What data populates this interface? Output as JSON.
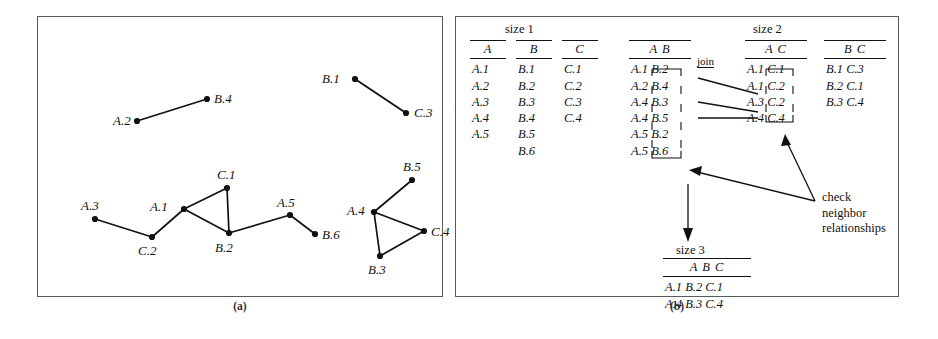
{
  "figure": {
    "caption_a": "(a)",
    "caption_b": "(b)"
  },
  "graph": {
    "nodes": [
      {
        "id": "A.2",
        "label": "A.2",
        "x": 100,
        "y": 105,
        "lx": 76,
        "ly": 98
      },
      {
        "id": "B.4",
        "label": "B.4",
        "x": 170,
        "y": 83,
        "lx": 177,
        "ly": 76
      },
      {
        "id": "B.1",
        "label": "B.1",
        "x": 318,
        "y": 63,
        "lx": 285,
        "ly": 56
      },
      {
        "id": "C.3",
        "label": "C.3",
        "x": 369,
        "y": 97,
        "lx": 377,
        "ly": 90
      },
      {
        "id": "A.3",
        "label": "A.3",
        "x": 58,
        "y": 203,
        "lx": 44,
        "ly": 183
      },
      {
        "id": "C.2",
        "label": "C.2",
        "x": 115,
        "y": 221,
        "lx": 101,
        "ly": 228
      },
      {
        "id": "A.1",
        "label": "A.1",
        "x": 147,
        "y": 193,
        "lx": 113,
        "ly": 184
      },
      {
        "id": "C.1",
        "label": "C.1",
        "x": 190,
        "y": 172,
        "lx": 180,
        "ly": 152
      },
      {
        "id": "B.2",
        "label": "B.2",
        "x": 192,
        "y": 217,
        "lx": 178,
        "ly": 225
      },
      {
        "id": "A.5",
        "label": "A.5",
        "x": 253,
        "y": 199,
        "lx": 240,
        "ly": 180
      },
      {
        "id": "B.6",
        "label": "B.6",
        "x": 278,
        "y": 218,
        "lx": 285,
        "ly": 212
      },
      {
        "id": "A.4",
        "label": "A.4",
        "x": 337,
        "y": 196,
        "lx": 310,
        "ly": 188
      },
      {
        "id": "B.5",
        "label": "B.5",
        "x": 375,
        "y": 164,
        "lx": 366,
        "ly": 144
      },
      {
        "id": "B.3",
        "label": "B.3",
        "x": 343,
        "y": 240,
        "lx": 331,
        "ly": 247
      },
      {
        "id": "C.4",
        "label": "C.4",
        "x": 387,
        "y": 215,
        "lx": 394,
        "ly": 209
      }
    ],
    "edges": [
      [
        "A.2",
        "B.4"
      ],
      [
        "B.1",
        "C.3"
      ],
      [
        "A.3",
        "C.2"
      ],
      [
        "C.2",
        "A.1"
      ],
      [
        "A.1",
        "C.1"
      ],
      [
        "A.1",
        "B.2"
      ],
      [
        "C.1",
        "B.2"
      ],
      [
        "B.2",
        "A.5"
      ],
      [
        "A.5",
        "B.6"
      ],
      [
        "A.4",
        "B.5"
      ],
      [
        "A.4",
        "B.3"
      ],
      [
        "A.4",
        "C.4"
      ],
      [
        "B.3",
        "C.4"
      ]
    ]
  },
  "tables": {
    "size1_heading": "size 1",
    "size2_heading": "size 2",
    "size3_heading": "size 3",
    "join_label": "join",
    "note": "check\nneighbor\nrelationships",
    "note_line1": "check",
    "note_line2": "neighbor",
    "note_line3": "relationships",
    "A": {
      "header": "A",
      "rows": [
        "A.1",
        "A.2",
        "A.3",
        "A.4",
        "A.5"
      ]
    },
    "B": {
      "header": "B",
      "rows": [
        "B.1",
        "B.2",
        "B.3",
        "B.4",
        "B.5",
        "B.6"
      ]
    },
    "C": {
      "header": "C",
      "rows": [
        "C.1",
        "C.2",
        "C.3",
        "C.4"
      ]
    },
    "AB": {
      "header": "A B",
      "rows": [
        "A.1 B.2",
        "A.2 B.4",
        "A.4 B.3",
        "A.4 B.5",
        "A.5 B.2",
        "A.5 B.6"
      ]
    },
    "AC": {
      "header": "A C",
      "rows": [
        "A.1 C.1",
        "A.1 C.2",
        "A.3 C.2",
        "A.4 C.4"
      ]
    },
    "BC": {
      "header": "B C",
      "rows": [
        "B.1 C.3",
        "B.2 C.1",
        "B.3 C.4"
      ]
    },
    "ABC": {
      "header": "A B C",
      "rows": [
        "A.1 B.2 C.1",
        "A.4 B.3 C.4"
      ]
    }
  }
}
